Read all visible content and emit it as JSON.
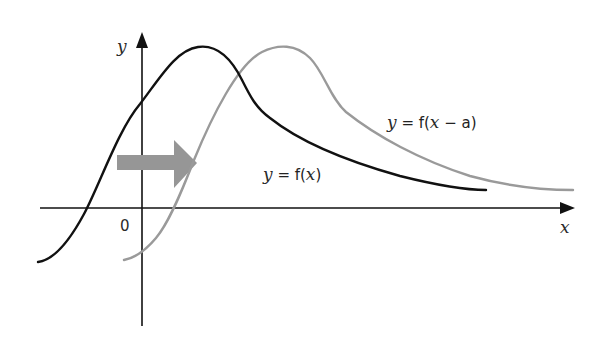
{
  "figure": {
    "type": "function-translation-diagram",
    "axes": {
      "x_label": "x",
      "y_label": "y",
      "origin_label": "0"
    },
    "curves": [
      {
        "name": "original",
        "label_var": "y",
        "label_eq": " = f(",
        "label_arg": "x",
        "label_close": ")",
        "color": "#111111"
      },
      {
        "name": "shifted",
        "label_var": "y",
        "label_eq": " = f(",
        "label_arg": "x",
        "label_rest": " − a)",
        "color": "#9a9a9a"
      }
    ],
    "shift_arrow": {
      "direction": "right",
      "color": "#969696"
    }
  }
}
